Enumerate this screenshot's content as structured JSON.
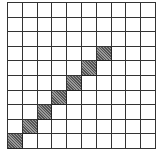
{
  "grid": {
    "rows": 10,
    "cols": 10,
    "shaded_cells": [
      {
        "row": 3,
        "col": 6
      },
      {
        "row": 4,
        "col": 5
      },
      {
        "row": 5,
        "col": 4
      },
      {
        "row": 6,
        "col": 3
      },
      {
        "row": 7,
        "col": 2
      },
      {
        "row": 8,
        "col": 1
      },
      {
        "row": 9,
        "col": 0
      }
    ],
    "colors": {
      "line": "#333333",
      "background": "#ffffff",
      "shaded": "#777777"
    }
  }
}
